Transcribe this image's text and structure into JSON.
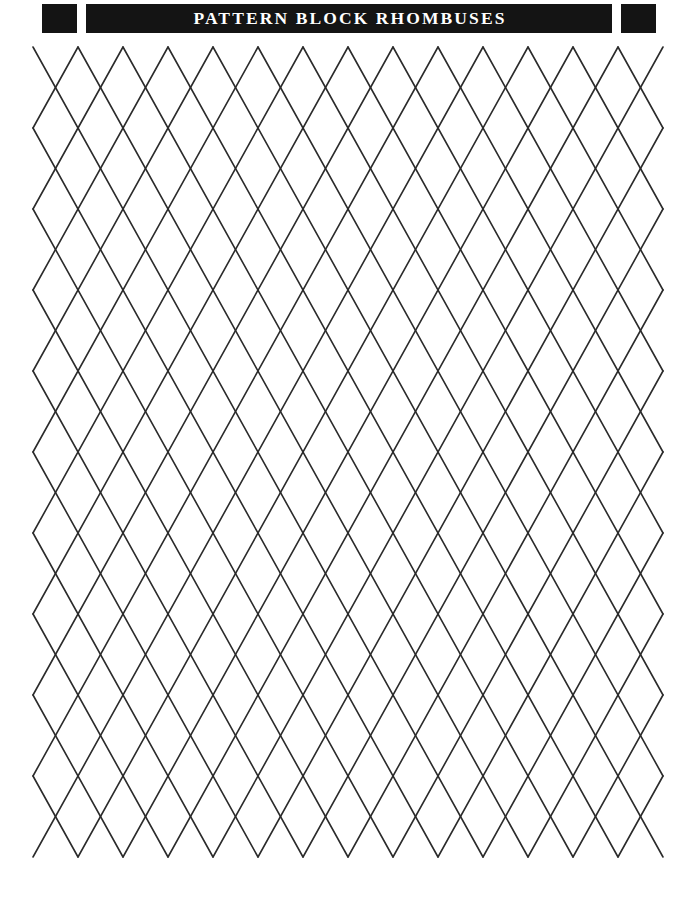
{
  "page": {
    "width": 696,
    "height": 906,
    "background_color": "#ffffff",
    "kind": "printable-worksheet"
  },
  "header": {
    "title": "PATTERN BLOCK RHOMBUSES",
    "bar_color": "#141414",
    "text_color": "#ffffff",
    "left_cap_label": "",
    "right_cap_label": ""
  },
  "lattice": {
    "shape_name": "rhombus",
    "stroke_color": "#2b2b2b",
    "stroke_width": 1.6,
    "columns": 7,
    "rows": 5,
    "half_width": 45,
    "half_height": 81,
    "origin_x": 78,
    "origin_y": 47,
    "left_edge_x": 33,
    "right_edge_x": 663,
    "bottom_y": 857
  }
}
